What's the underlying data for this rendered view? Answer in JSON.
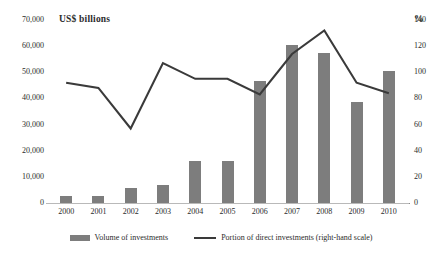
{
  "chart_data": {
    "type": "bar",
    "title": "",
    "categories": [
      "2000",
      "2001",
      "2002",
      "2003",
      "2004",
      "2005",
      "2006",
      "2007",
      "2008",
      "2009",
      "2010"
    ],
    "xlabel": "",
    "ylabel_left": "US$  billions",
    "ylabel_right": "%",
    "ylim_left": [
      0,
      70000
    ],
    "ylim_right": [
      0,
      140
    ],
    "ytick_labels_left": [
      "70,000",
      "60,000",
      "50,000",
      "40,000",
      "30,000",
      "20,000",
      "10,000",
      "0"
    ],
    "ytick_values_left": [
      70000,
      60000,
      50000,
      40000,
      30000,
      20000,
      10000,
      0
    ],
    "ytick_labels_right": [
      "140",
      "120",
      "100",
      "80",
      "60",
      "40",
      "20",
      "0"
    ],
    "ytick_values_right": [
      140,
      120,
      100,
      80,
      60,
      40,
      20,
      0
    ],
    "grid": false,
    "legend_position": "bottom",
    "series": [
      {
        "name": "Volume of investments",
        "type": "bar",
        "axis": "left",
        "color": "#7d7d7d",
        "values": [
          2700,
          2700,
          5700,
          6900,
          16200,
          16200,
          46500,
          60500,
          57500,
          38800,
          50500
        ]
      },
      {
        "name": "Portion of direct investments (right-hand scale)",
        "type": "line",
        "axis": "right",
        "color": "#3a3a3a",
        "values": [
          92,
          88,
          57,
          107,
          95,
          95,
          83,
          114,
          132,
          92,
          84
        ]
      }
    ]
  },
  "legend": {
    "items": [
      {
        "label": "Volume of investments",
        "marker": "bar-swatch"
      },
      {
        "label": "Portion of direct investments (right-hand scale)",
        "marker": "line-swatch"
      }
    ]
  }
}
